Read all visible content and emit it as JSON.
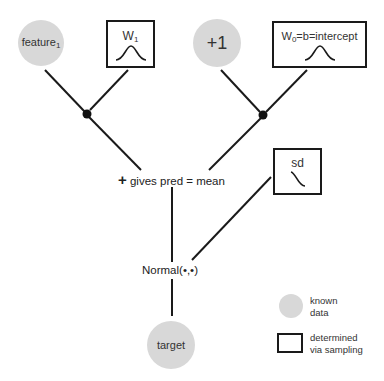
{
  "nodes": {
    "feature": {
      "label": "feature",
      "subscript": "1",
      "type": "known_data"
    },
    "w1": {
      "label": "W",
      "subscript": "1",
      "curve": "bell",
      "type": "sampled"
    },
    "plus_one": {
      "label": "+1",
      "type": "known_data"
    },
    "w0": {
      "label": "W",
      "subscript": "0",
      "suffix": "=b=intercept",
      "curve": "bell",
      "type": "sampled"
    },
    "sum": {
      "plus": "+",
      "label": "gives pred = mean"
    },
    "sd": {
      "label": "sd",
      "curve": "half-decay",
      "type": "sampled"
    },
    "normal": {
      "label": "Normal(•,•)"
    },
    "target": {
      "label": "target",
      "type": "known_data"
    }
  },
  "legend": {
    "known": {
      "line1": "known",
      "line2": "data"
    },
    "sampled": {
      "line1": "determined",
      "line2": "via sampling"
    }
  },
  "colors": {
    "known_fill": "#d8d8d8",
    "line": "#1a1a1a"
  }
}
